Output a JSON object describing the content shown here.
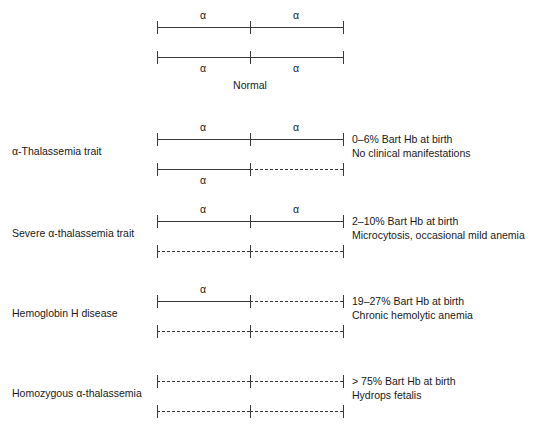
{
  "figure": {
    "title_caption": "Normal",
    "allele_symbol": "α"
  },
  "chart_data": {
    "type": "diagram",
    "xlabel": "",
    "ylabel": "",
    "grid": false,
    "legend": "none",
    "notation": {
      "solid_line": "present (functional) α-globin gene locus",
      "dashed_line": "deleted α-globin gene locus",
      "tick": "gene locus boundary marker",
      "alpha_label": "α"
    },
    "groups": [
      {
        "id": "normal",
        "label": "",
        "caption": "Normal",
        "genotype_alpha_count": 4,
        "description_lines": [],
        "chromosomes": [
          {
            "index": 0,
            "alpha_label_position": "above",
            "segments": [
              {
                "side": "left",
                "present": true,
                "alpha": "α"
              },
              {
                "side": "right",
                "present": true,
                "alpha": "α"
              }
            ]
          },
          {
            "index": 1,
            "alpha_label_position": "below",
            "segments": [
              {
                "side": "left",
                "present": true,
                "alpha": "α"
              },
              {
                "side": "right",
                "present": true,
                "alpha": "α"
              }
            ]
          }
        ]
      },
      {
        "id": "alpha-thalassemia-trait",
        "label": "α-Thalassemia trait",
        "caption": "",
        "genotype_alpha_count": 3,
        "description_lines": [
          "0–6% Bart Hb at birth",
          "No clinical manifestations"
        ],
        "chromosomes": [
          {
            "index": 0,
            "alpha_label_position": "above",
            "segments": [
              {
                "side": "left",
                "present": true,
                "alpha": "α"
              },
              {
                "side": "right",
                "present": true,
                "alpha": "α"
              }
            ]
          },
          {
            "index": 1,
            "alpha_label_position": "below",
            "segments": [
              {
                "side": "left",
                "present": true,
                "alpha": "α"
              },
              {
                "side": "right",
                "present": false,
                "alpha": ""
              }
            ]
          }
        ]
      },
      {
        "id": "severe-alpha-thalassemia-trait",
        "label": "Severe α-thalassemia trait",
        "caption": "",
        "genotype_alpha_count": 2,
        "description_lines": [
          "2–10% Bart Hb at birth",
          "Microcytosis, occasional mild anemia"
        ],
        "chromosomes": [
          {
            "index": 0,
            "alpha_label_position": "above",
            "segments": [
              {
                "side": "left",
                "present": true,
                "alpha": "α"
              },
              {
                "side": "right",
                "present": true,
                "alpha": "α"
              }
            ]
          },
          {
            "index": 1,
            "alpha_label_position": "below",
            "segments": [
              {
                "side": "left",
                "present": false,
                "alpha": ""
              },
              {
                "side": "right",
                "present": false,
                "alpha": ""
              }
            ]
          }
        ]
      },
      {
        "id": "hemoglobin-h-disease",
        "label": "Hemoglobin H disease",
        "caption": "",
        "genotype_alpha_count": 1,
        "description_lines": [
          "19–27% Bart Hb at birth",
          "Chronic hemolytic anemia"
        ],
        "chromosomes": [
          {
            "index": 0,
            "alpha_label_position": "above",
            "segments": [
              {
                "side": "left",
                "present": true,
                "alpha": "α"
              },
              {
                "side": "right",
                "present": false,
                "alpha": ""
              }
            ]
          },
          {
            "index": 1,
            "alpha_label_position": "below",
            "segments": [
              {
                "side": "left",
                "present": false,
                "alpha": ""
              },
              {
                "side": "right",
                "present": false,
                "alpha": ""
              }
            ]
          }
        ]
      },
      {
        "id": "homozygous-alpha-thalassemia",
        "label": "Homozygous α-thalassemia",
        "caption": "",
        "genotype_alpha_count": 0,
        "description_lines": [
          "> 75% Bart Hb at birth",
          "Hydrops fetalis"
        ],
        "chromosomes": [
          {
            "index": 0,
            "alpha_label_position": "above",
            "segments": [
              {
                "side": "left",
                "present": false,
                "alpha": ""
              },
              {
                "side": "right",
                "present": false,
                "alpha": ""
              }
            ]
          },
          {
            "index": 1,
            "alpha_label_position": "below",
            "segments": [
              {
                "side": "left",
                "present": false,
                "alpha": ""
              },
              {
                "side": "right",
                "present": false,
                "alpha": ""
              }
            ]
          }
        ]
      }
    ]
  }
}
